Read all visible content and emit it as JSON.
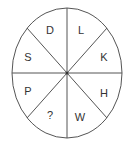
{
  "diagram": {
    "type": "letter-wheel",
    "segments": 8,
    "colors": {
      "stroke": "#555555",
      "text": "#333333",
      "background": "#ffffff"
    },
    "sectors": [
      {
        "position": "top-left",
        "label": "D"
      },
      {
        "position": "top-right",
        "label": "L"
      },
      {
        "position": "right-upper",
        "label": "K"
      },
      {
        "position": "right-lower",
        "label": "H"
      },
      {
        "position": "bottom-right",
        "label": "W"
      },
      {
        "position": "bottom-left",
        "label": "?"
      },
      {
        "position": "left-lower",
        "label": "P"
      },
      {
        "position": "left-upper",
        "label": "S"
      }
    ]
  }
}
